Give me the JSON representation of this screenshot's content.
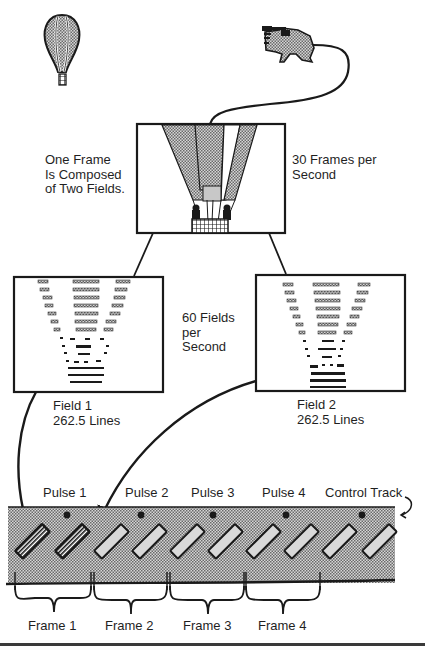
{
  "diagram": {
    "labels": {
      "frame_composition": "One Frame\nIs Composed\nof Two Fields.",
      "frame_rate": "30 Frames per\nSecond",
      "field_rate": "60 Fields\nper\nSecond",
      "field1": "Field 1\n262.5 Lines",
      "field2": "Field 2\n262.5 Lines",
      "control_track": "Control Track"
    },
    "pulses": [
      {
        "label": "Pulse 1"
      },
      {
        "label": "Pulse 2"
      },
      {
        "label": "Pulse 3"
      },
      {
        "label": "Pulse 4"
      }
    ],
    "frames": [
      {
        "label": "Frame 1"
      },
      {
        "label": "Frame 2"
      },
      {
        "label": "Frame 3"
      },
      {
        "label": "Frame 4"
      }
    ],
    "icons": {
      "balloon": "hot-air-balloon-icon",
      "camera": "video-camera-icon"
    },
    "colors": {
      "ink": "#1a1a1a",
      "tape_fill": "#b8b8b8",
      "stripe_fill": "#9a9a9a",
      "background": "#ffffff"
    },
    "tape": {
      "track_count": 10,
      "highlighted_tracks": 2
    }
  }
}
